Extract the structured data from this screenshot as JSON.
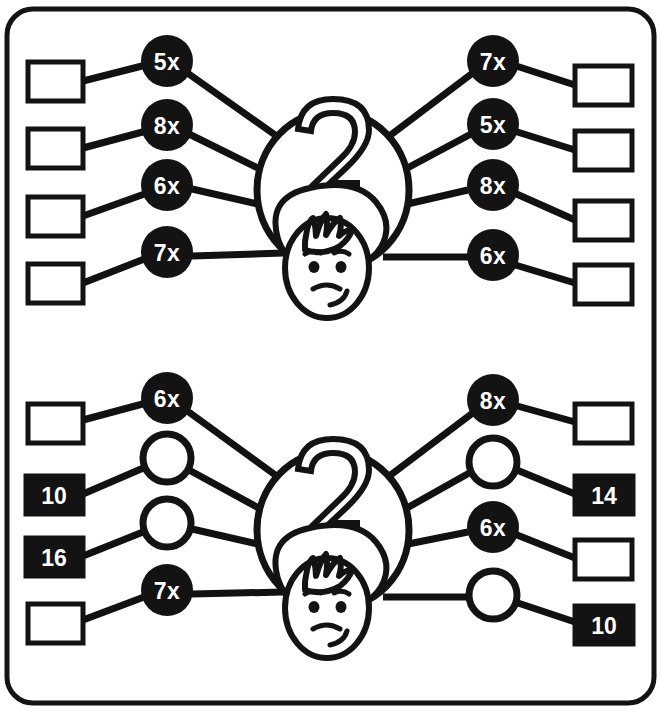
{
  "worksheet": {
    "title": "Multiplication wheel worksheet",
    "background_color": "#ffffff",
    "ink_color": "#131313",
    "border": {
      "shape": "rounded-rectangle",
      "corner_radius": 26
    }
  },
  "sections": [
    {
      "id": "top",
      "center": {
        "label": "2",
        "character": "upside-down-face-balloon"
      },
      "left_spokes": [
        {
          "node": {
            "label": "5x",
            "style": "filled"
          },
          "box": {
            "value": "",
            "style": "empty"
          }
        },
        {
          "node": {
            "label": "8x",
            "style": "filled"
          },
          "box": {
            "value": "",
            "style": "empty"
          }
        },
        {
          "node": {
            "label": "6x",
            "style": "filled"
          },
          "box": {
            "value": "",
            "style": "empty"
          }
        },
        {
          "node": {
            "label": "7x",
            "style": "filled"
          },
          "box": {
            "value": "",
            "style": "empty"
          }
        }
      ],
      "right_spokes": [
        {
          "node": {
            "label": "7x",
            "style": "filled"
          },
          "box": {
            "value": "",
            "style": "empty"
          }
        },
        {
          "node": {
            "label": "5x",
            "style": "filled"
          },
          "box": {
            "value": "",
            "style": "empty"
          }
        },
        {
          "node": {
            "label": "8x",
            "style": "filled"
          },
          "box": {
            "value": "",
            "style": "empty"
          }
        },
        {
          "node": {
            "label": "6x",
            "style": "filled"
          },
          "box": {
            "value": "",
            "style": "empty"
          }
        }
      ]
    },
    {
      "id": "bottom",
      "center": {
        "label": "2",
        "character": "upside-down-face-balloon"
      },
      "left_spokes": [
        {
          "node": {
            "label": "6x",
            "style": "filled"
          },
          "box": {
            "value": "",
            "style": "empty"
          }
        },
        {
          "node": {
            "label": "",
            "style": "open"
          },
          "box": {
            "value": "10",
            "style": "filled"
          }
        },
        {
          "node": {
            "label": "",
            "style": "open"
          },
          "box": {
            "value": "16",
            "style": "filled"
          }
        },
        {
          "node": {
            "label": "7x",
            "style": "filled"
          },
          "box": {
            "value": "",
            "style": "empty"
          }
        }
      ],
      "right_spokes": [
        {
          "node": {
            "label": "8x",
            "style": "filled"
          },
          "box": {
            "value": "",
            "style": "empty"
          }
        },
        {
          "node": {
            "label": "",
            "style": "open"
          },
          "box": {
            "value": "14",
            "style": "filled"
          }
        },
        {
          "node": {
            "label": "6x",
            "style": "filled"
          },
          "box": {
            "value": "",
            "style": "empty"
          }
        },
        {
          "node": {
            "label": "",
            "style": "open"
          },
          "box": {
            "value": "10",
            "style": "filled"
          }
        }
      ]
    }
  ],
  "geometry": {
    "top": {
      "balloon_cx": 333,
      "balloon_cy": 190,
      "left_nodes_y": [
        61,
        125,
        185,
        252
      ],
      "right_nodes_y": [
        61,
        124,
        185,
        255
      ],
      "left_boxes_y": [
        62,
        125,
        194,
        262
      ],
      "right_boxes_y": [
        66,
        131,
        203,
        265
      ],
      "left_node_cx": 167,
      "right_node_cx": 493,
      "left_box_x": 28,
      "right_box_x": 575
    },
    "bottom": {
      "balloon_cx": 333,
      "balloon_cy": 530,
      "left_nodes_y": [
        398,
        458,
        523,
        590
      ],
      "right_nodes_y": [
        400,
        462,
        527,
        595
      ],
      "left_boxes_y": [
        404,
        476,
        538,
        604
      ],
      "right_boxes_y": [
        404,
        476,
        540,
        606
      ],
      "left_node_cx": 167,
      "right_node_cx": 493,
      "left_box_x": 28,
      "right_box_x": 575
    }
  }
}
